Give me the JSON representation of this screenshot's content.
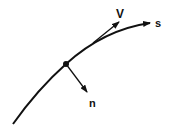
{
  "diagram": {
    "type": "vector-diagram",
    "labels": {
      "velocity": "V",
      "path": "s",
      "normal": "n"
    },
    "colors": {
      "stroke": "#111111",
      "background": "#ffffff"
    }
  }
}
